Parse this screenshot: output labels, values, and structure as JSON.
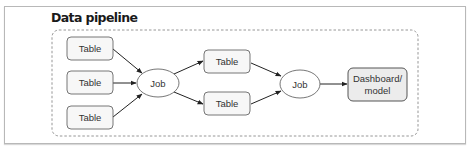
{
  "title": "Data pipeline",
  "nodes": {
    "table_1": {
      "label": "Table",
      "type": "table"
    },
    "table_2": {
      "label": "Table",
      "type": "table"
    },
    "table_3": {
      "label": "Table",
      "type": "table"
    },
    "job_1": {
      "label": "Job",
      "type": "job"
    },
    "table_4": {
      "label": "Table",
      "type": "table"
    },
    "table_5": {
      "label": "Table",
      "type": "table"
    },
    "job_2": {
      "label": "Job",
      "type": "job"
    },
    "output": {
      "label_line1": "Dashboard/",
      "label_line2": "model",
      "type": "output"
    }
  },
  "edges": [
    {
      "from": "table_1",
      "to": "job_1"
    },
    {
      "from": "table_2",
      "to": "job_1"
    },
    {
      "from": "table_3",
      "to": "job_1"
    },
    {
      "from": "job_1",
      "to": "table_4"
    },
    {
      "from": "job_1",
      "to": "table_5"
    },
    {
      "from": "table_4",
      "to": "job_2"
    },
    {
      "from": "table_5",
      "to": "job_2"
    },
    {
      "from": "job_2",
      "to": "output"
    }
  ],
  "colors": {
    "node_fill": "#f7f7f7",
    "output_fill": "#ececec",
    "node_stroke": "#666666",
    "edge": "#222222",
    "container_dash": "#8a8a8a"
  }
}
